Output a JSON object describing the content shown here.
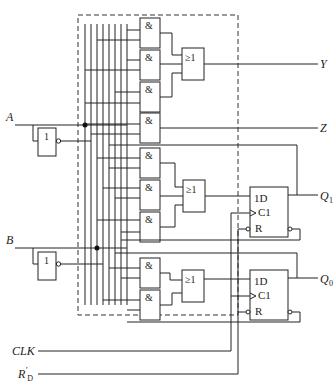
{
  "diagram": {
    "title": "",
    "inputs": {
      "a": "A",
      "b": "B",
      "clk": "CLK",
      "rd_main": "R",
      "rd_prime": "′",
      "rd_sub": "D"
    },
    "outputs": {
      "y": "Y",
      "z": "Z",
      "q1_main": "Q",
      "q1_sub": "1",
      "q0_main": "Q",
      "q0_sub": "0"
    },
    "gates": {
      "and_symbol": "&",
      "or_symbol": "≥1",
      "not_symbol": "1"
    },
    "flipflops": {
      "d_label": "1D",
      "clk_label": "C1",
      "reset_label": "R"
    }
  }
}
